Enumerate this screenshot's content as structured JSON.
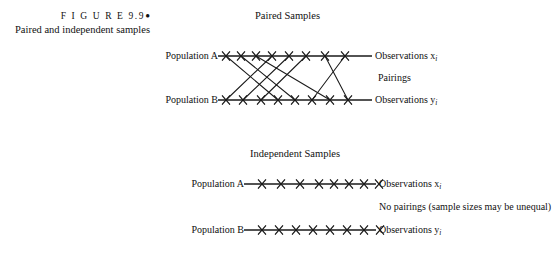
{
  "figure": {
    "number_label": "F I G U R E  9.9",
    "bullet": "●",
    "caption": "Paired and independent samples"
  },
  "sections": {
    "paired": {
      "title": "Paired Samples",
      "population_a_label": "Population A",
      "population_b_label": "Population B",
      "observations_x_label": "Observations x",
      "observations_x_sub": "i",
      "observations_y_label": "Observations y",
      "observations_y_sub": "i",
      "middle_label": "Pairings"
    },
    "independent": {
      "title": "Independent Samples",
      "population_a_label": "Population A",
      "population_b_label": "Population B",
      "observations_x_label": "Observations x",
      "observations_x_sub": "i",
      "observations_y_label": "Observations y",
      "observations_y_sub": "i",
      "middle_label": "No pairings (sample sizes may be unequal)"
    }
  },
  "chart_data": {
    "type": "diagram",
    "title": "Paired and independent samples",
    "colors": {
      "ink": "#1a1a1a",
      "background": "#ffffff"
    },
    "panels": [
      {
        "name": "paired",
        "title": "Paired Samples",
        "line_a": {
          "x1": 218,
          "x2": 372,
          "y": 56
        },
        "line_b": {
          "x1": 218,
          "x2": 372,
          "y": 100
        },
        "ticks_a": [
          226,
          241,
          256,
          272,
          289,
          306,
          325,
          345
        ],
        "ticks_b": [
          226,
          243,
          261,
          278,
          295,
          312,
          330,
          348
        ],
        "n_a": 8,
        "n_b": 8,
        "pairings": [
          [
            226,
            278
          ],
          [
            241,
            295
          ],
          [
            256,
            330
          ],
          [
            272,
            226
          ],
          [
            289,
            243
          ],
          [
            306,
            261
          ],
          [
            325,
            348
          ],
          [
            345,
            312
          ]
        ]
      },
      {
        "name": "independent",
        "title": "Independent Samples",
        "line_a": {
          "x1": 244,
          "x2": 376,
          "y": 184
        },
        "line_b": {
          "x1": 244,
          "x2": 376,
          "y": 230
        },
        "ticks_a": [
          262,
          281,
          300,
          319,
          334,
          349,
          364,
          379
        ],
        "ticks_b": [
          262,
          279,
          296,
          313,
          330,
          347,
          364,
          380
        ],
        "n_a": 8,
        "n_b": 8,
        "pairings": []
      }
    ]
  }
}
